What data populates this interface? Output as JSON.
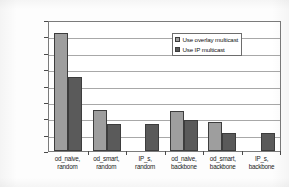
{
  "chart_data": {
    "type": "bar",
    "title": "",
    "xlabel": "",
    "ylabel": "Multicast bandwidth consumption (KB*sec)",
    "ylim": [
      0,
      40000
    ],
    "ytick_labels": [
      "0",
      "5000",
      "10000",
      "15000",
      "20000",
      "25000",
      "30000",
      "35000",
      "40000"
    ],
    "ytick_values": [
      0,
      5000,
      10000,
      15000,
      20000,
      25000,
      30000,
      35000,
      40000
    ],
    "grid": "horizontal",
    "legend_position": "upper-right-inside",
    "categories": [
      "od_naive, random",
      "od_smart, random",
      "IP_s, random",
      "od_naive, backbone",
      "od_smart, backbone",
      "IP_s, backbone"
    ],
    "category_lines": [
      [
        "od_naive,",
        "random"
      ],
      [
        "od_smart,",
        "random"
      ],
      [
        "IP_s,",
        "random"
      ],
      [
        "od_naive,",
        "backbone"
      ],
      [
        "od_smart,",
        "backbone"
      ],
      [
        "IP_s,",
        "backbone"
      ]
    ],
    "series": [
      {
        "name": "Use overlay multicast",
        "color": "#9e9e9e",
        "values": [
          36000,
          12500,
          null,
          12100,
          9000,
          null
        ]
      },
      {
        "name": "Use IP multicast",
        "color": "#5a5a5a",
        "values": [
          22500,
          8200,
          8300,
          9500,
          5600,
          5600
        ]
      }
    ]
  },
  "legend": {
    "items": [
      {
        "label": "Use overlay multicast",
        "swatch": "overlay"
      },
      {
        "label": "Use IP multicast",
        "swatch": "ip"
      }
    ]
  }
}
